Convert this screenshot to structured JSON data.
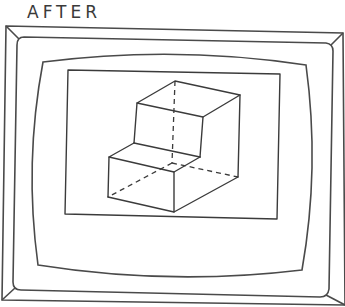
{
  "figure": {
    "title": "AFTER",
    "colors": {
      "line": "#3b3b3b",
      "background": "#ffffff"
    }
  },
  "monitor": {
    "outer_frame": [
      [
        6,
        26
      ],
      [
        343,
        33
      ],
      [
        345,
        305
      ],
      [
        2,
        300
      ]
    ],
    "bezel": [
      [
        17,
        37
      ],
      [
        333,
        43
      ],
      [
        328,
        297
      ],
      [
        13,
        290
      ]
    ],
    "screen": [
      [
        43,
        62
      ],
      [
        306,
        65
      ],
      [
        302,
        270
      ],
      [
        38,
        265
      ]
    ],
    "viewport": [
      [
        68,
        70
      ],
      [
        280,
        74
      ],
      [
        277,
        219
      ],
      [
        65,
        214
      ]
    ]
  },
  "block": {
    "visible_edges": [
      [
        [
          175,
          81
        ],
        [
          240,
          95
        ]
      ],
      [
        [
          175,
          81
        ],
        [
          137,
          103
        ]
      ],
      [
        [
          137,
          103
        ],
        [
          203,
          117
        ]
      ],
      [
        [
          203,
          117
        ],
        [
          240,
          95
        ]
      ],
      [
        [
          137,
          103
        ],
        [
          134,
          143
        ]
      ],
      [
        [
          203,
          117
        ],
        [
          200,
          157
        ]
      ],
      [
        [
          240,
          95
        ],
        [
          238,
          177
        ]
      ],
      [
        [
          134,
          143
        ],
        [
          200,
          157
        ]
      ],
      [
        [
          134,
          143
        ],
        [
          109,
          157
        ]
      ],
      [
        [
          200,
          157
        ],
        [
          174,
          172
        ]
      ],
      [
        [
          109,
          157
        ],
        [
          174,
          172
        ]
      ],
      [
        [
          109,
          157
        ],
        [
          108,
          197
        ]
      ],
      [
        [
          174,
          172
        ],
        [
          174,
          212
        ]
      ],
      [
        [
          108,
          197
        ],
        [
          174,
          212
        ]
      ],
      [
        [
          174,
          212
        ],
        [
          238,
          177
        ]
      ]
    ],
    "hidden_edges": [
      [
        [
          175,
          81
        ],
        [
          172,
          163
        ]
      ],
      [
        [
          172,
          163
        ],
        [
          108,
          197
        ]
      ],
      [
        [
          172,
          163
        ],
        [
          238,
          177
        ]
      ]
    ]
  }
}
